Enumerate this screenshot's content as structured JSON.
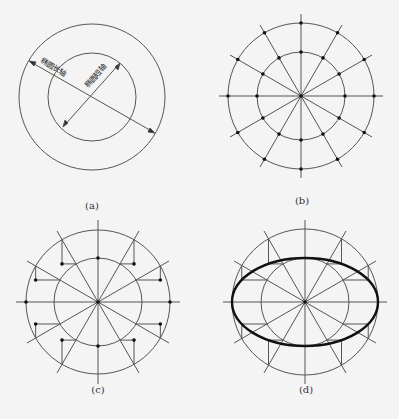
{
  "panels": [
    {
      "id": "a",
      "caption": "(a)",
      "labels": {
        "major_axis": "椭圆长轴",
        "minor_axis": "椭圆短轴"
      }
    },
    {
      "id": "b",
      "caption": "(b)"
    },
    {
      "id": "c",
      "caption": "(c)"
    },
    {
      "id": "d",
      "caption": "(d)"
    }
  ],
  "colors": {
    "line": "#555555",
    "ellipse": "#111111",
    "background": "#f4f4f4"
  }
}
